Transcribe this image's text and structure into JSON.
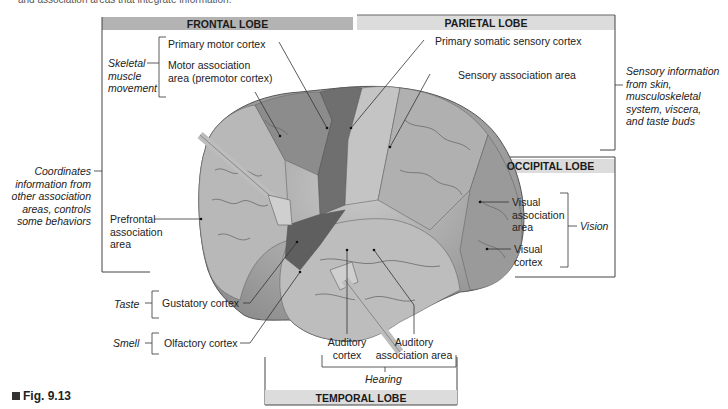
{
  "caption_top": "and association areas that integrate information.",
  "figure_label": "Fig. 9.13",
  "lobes": {
    "frontal": "FRONTAL LOBE",
    "parietal": "PARIETAL LOBE",
    "occipital": "OCCIPITAL LOBE",
    "temporal": "TEMPORAL LOBE"
  },
  "labels": {
    "primary_motor": "Primary motor cortex",
    "motor_association": [
      "Motor association",
      "area (premotor cortex)"
    ],
    "primary_somatic": "Primary somatic sensory cortex",
    "sensory_association": "Sensory association area",
    "prefrontal": [
      "Prefrontal",
      "association",
      "area"
    ],
    "visual_association": [
      "Visual",
      "association",
      "area"
    ],
    "visual_cortex": [
      "Visual",
      "cortex"
    ],
    "gustatory": "Gustatory cortex",
    "olfactory": "Olfactory cortex",
    "auditory_cortex": [
      "Auditory",
      "cortex"
    ],
    "auditory_association": [
      "Auditory",
      "association area"
    ]
  },
  "functions": {
    "skeletal": [
      "Skeletal",
      "muscle",
      "movement"
    ],
    "coordinates": [
      "Coordinates",
      "information from",
      "other association",
      "areas, controls",
      "some behaviors"
    ],
    "sensory_info": [
      "Sensory information",
      "from skin,",
      "musculoskeletal",
      "system, viscera,",
      "and taste buds"
    ],
    "vision": "Vision",
    "taste": "Taste",
    "smell": "Smell",
    "hearing": "Hearing"
  },
  "colors": {
    "header_dark": "#b3b3b3",
    "header_light": "#dcdcdc",
    "line": "#333333",
    "brain_base": "#a9a9a9",
    "motor_dark": "#6f6f6f",
    "sensory_light": "#c4c4c4"
  }
}
